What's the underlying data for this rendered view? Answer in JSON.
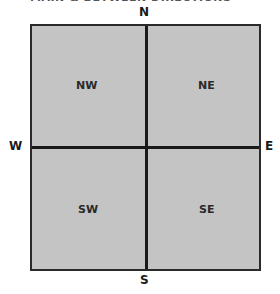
{
  "title": "MAIN & BETWEEN DIRECTIONS",
  "compass": {
    "north": "N",
    "south": "S",
    "east": "E",
    "west": "W"
  },
  "quadrants": {
    "nw": "NW",
    "ne": "NE",
    "sw": "SW",
    "se": "SE"
  },
  "colors": {
    "box_fill": "#c4c4c4",
    "lines": "#1a1a1a",
    "text": "#2a2a2a"
  }
}
